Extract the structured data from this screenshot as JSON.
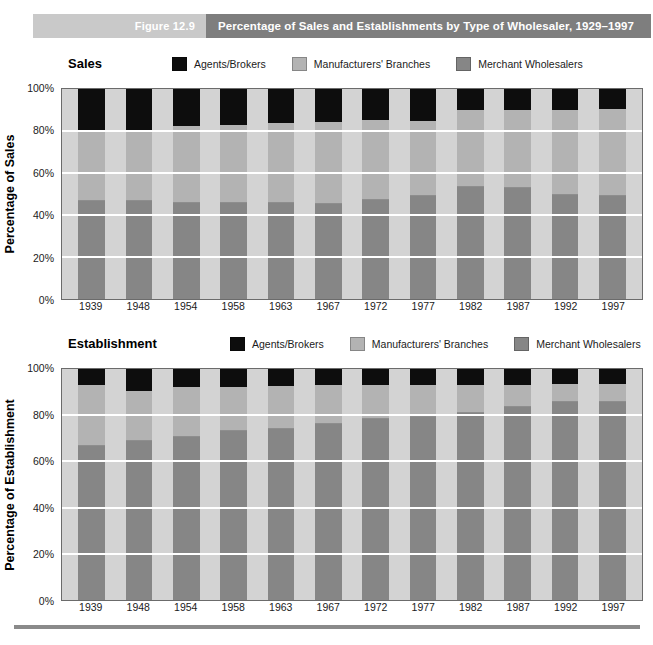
{
  "header": {
    "figure_number": "Figure 12.9",
    "title": "Percentage of Sales and Establishments by Type of Wholesaler, 1929–1997"
  },
  "colors": {
    "agents": "#0d0d0d",
    "branches": "#b3b3b3",
    "merchant": "#868686",
    "plot_background": "#d3d3d3",
    "gridline": "#ffffff",
    "header_band_left": "#c9c9c9",
    "header_band_right": "#7e7e7e"
  },
  "legend": [
    {
      "label": "Agents/Brokers",
      "key": "agents"
    },
    {
      "label": "Manufacturers' Branches",
      "key": "branches"
    },
    {
      "label": "Merchant Wholesalers",
      "key": "merchant"
    }
  ],
  "panels": [
    {
      "name": "Sales",
      "ylabel": "Percentage of Sales",
      "yticks": [
        "100%",
        "80%",
        "60%",
        "40%",
        "20%",
        "0%"
      ]
    },
    {
      "name": "Establishment",
      "ylabel": "Percentage of Establishment",
      "yticks": [
        "100%",
        "80%",
        "60%",
        "40%",
        "20%",
        "0%"
      ]
    }
  ],
  "chart_data": [
    {
      "type": "bar",
      "subtype": "stacked-percent",
      "title": "Sales",
      "xlabel": "",
      "ylabel": "Percentage of Sales",
      "ylim": [
        0,
        100
      ],
      "yticks": [
        0,
        20,
        40,
        60,
        80,
        100
      ],
      "grid": true,
      "legend_position": "top",
      "categories": [
        "1939",
        "1948",
        "1954",
        "1958",
        "1963",
        "1967",
        "1972",
        "1977",
        "1982",
        "1987",
        "1992",
        "1997"
      ],
      "series": [
        {
          "name": "Merchant Wholesalers",
          "values": [
            47,
            47,
            46,
            46,
            46,
            45.5,
            47.5,
            49.5,
            53.5,
            53,
            50,
            49.5
          ]
        },
        {
          "name": "Manufacturers' Branches",
          "values": [
            33,
            33.5,
            36.5,
            37,
            37.5,
            38.5,
            37.5,
            35,
            36.5,
            37,
            40,
            41
          ]
        },
        {
          "name": "Agents/Brokers",
          "values": [
            20,
            19.5,
            17.5,
            17,
            16.5,
            16,
            15,
            15.5,
            10,
            10,
            10,
            9.5
          ]
        }
      ]
    },
    {
      "type": "bar",
      "subtype": "stacked-percent",
      "title": "Establishment",
      "xlabel": "",
      "ylabel": "Percentage of Establishment",
      "ylim": [
        0,
        100
      ],
      "yticks": [
        0,
        20,
        40,
        60,
        80,
        100
      ],
      "grid": true,
      "legend_position": "top",
      "categories": [
        "1939",
        "1948",
        "1954",
        "1958",
        "1963",
        "1967",
        "1972",
        "1977",
        "1982",
        "1987",
        "1992",
        "1997"
      ],
      "series": [
        {
          "name": "Merchant Wholesalers",
          "values": [
            67,
            69,
            71,
            73.5,
            74.5,
            76.5,
            78.5,
            79.5,
            81.5,
            84,
            86,
            86
          ]
        },
        {
          "name": "Manufacturers' Branches",
          "values": [
            26,
            21.5,
            21,
            18.5,
            18,
            16.5,
            14.5,
            13.5,
            11.5,
            9,
            7.5,
            7.5
          ]
        },
        {
          "name": "Agents/Brokers",
          "values": [
            7,
            9.5,
            8,
            8,
            7.5,
            7,
            7,
            7,
            7,
            7,
            6.5,
            6.5
          ]
        }
      ]
    }
  ]
}
